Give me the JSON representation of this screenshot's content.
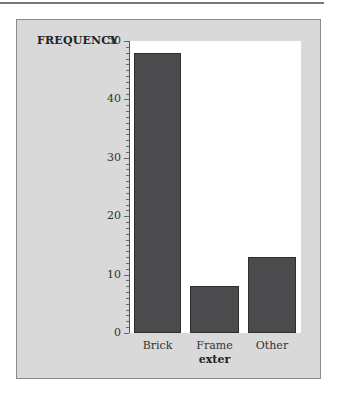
{
  "chart_data": {
    "type": "bar",
    "title": "",
    "xlabel": "exter",
    "ylabel": "FREQUENCY",
    "categories": [
      "Brick",
      "Frame",
      "Other"
    ],
    "values": [
      48,
      8,
      13
    ],
    "ylim": [
      0,
      50
    ],
    "yticks": [
      0,
      10,
      20,
      30,
      40,
      50
    ],
    "minor_ticks_per_unit": 1,
    "grid": false,
    "legend": null,
    "colors": {
      "bar": "#4b4b4d",
      "panel_background": "#d9d9d9",
      "plot_background": "#ffffff"
    }
  }
}
